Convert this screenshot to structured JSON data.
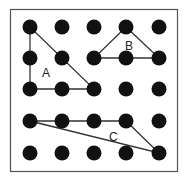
{
  "diagram": {
    "type": "geoboard",
    "grid": {
      "cols": 5,
      "rows": 5
    },
    "colors": {
      "dot": "#111111",
      "line": "#333333",
      "border": "#555555"
    },
    "shapes": [
      {
        "label": "A",
        "vertices": [
          [
            0,
            0
          ],
          [
            0,
            2
          ],
          [
            2,
            2
          ]
        ]
      },
      {
        "label": "B",
        "vertices": [
          [
            3,
            0
          ],
          [
            2,
            1
          ],
          [
            4,
            1
          ]
        ]
      },
      {
        "label": "C",
        "vertices": [
          [
            0,
            3
          ],
          [
            3,
            3
          ],
          [
            4,
            4
          ]
        ]
      }
    ]
  },
  "labels": {
    "a": "A",
    "b": "B",
    "c": "C"
  }
}
